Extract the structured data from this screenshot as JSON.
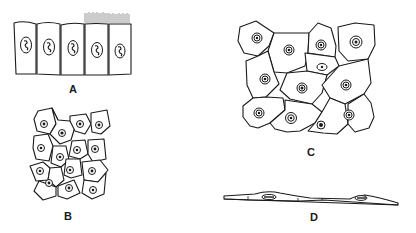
{
  "figure": {
    "panels": [
      {
        "id": "A",
        "label": "A",
        "description": "Simple columnar epithelium; row of five tall cells, two rightmost with cilia"
      },
      {
        "id": "B",
        "label": "B",
        "description": "Simple cuboidal/polygonal epithelium (surface view), small cells with central nuclei"
      },
      {
        "id": "C",
        "label": "C",
        "description": "Squamous epithelium (surface view), large irregular polygonal cells with central nuclei"
      },
      {
        "id": "D",
        "label": "D",
        "description": "Simple squamous epithelium (side view), thin flat cells with flattened nuclei"
      }
    ]
  },
  "colors": {
    "ink": "#1a1a1a",
    "background": "#ffffff",
    "cilia": "#555555"
  }
}
